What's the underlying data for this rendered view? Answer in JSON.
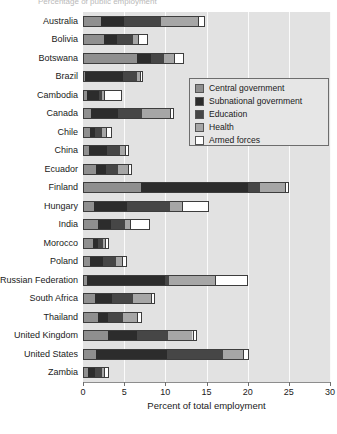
{
  "top_clipped_text": "Percentage of public employment",
  "chart_data": {
    "type": "bar",
    "orientation": "horizontal-stacked",
    "title": "",
    "xlabel": "Percent of total employment",
    "ylabel": "",
    "xlim": [
      0,
      30
    ],
    "xticks": [
      0,
      5,
      10,
      15,
      20,
      25,
      30
    ],
    "grid": true,
    "legend_position": "inside-upper-right",
    "categories": [
      "Australia",
      "Bolivia",
      "Botswana",
      "Brazil",
      "Cambodia",
      "Canada",
      "Chile",
      "China",
      "Ecuador",
      "Finland",
      "Hungary",
      "India",
      "Morocco",
      "Poland",
      "Russian Federation",
      "South Africa",
      "Thailand",
      "United Kingdom",
      "United States",
      "Zambia"
    ],
    "series": [
      {
        "name": "Central government",
        "color": "#8f8f8f",
        "values": [
          2.2,
          2.6,
          6.5,
          0.3,
          0.5,
          1.0,
          0.9,
          0.7,
          1.6,
          7.0,
          1.3,
          1.8,
          1.2,
          0.8,
          0.5,
          1.5,
          1.8,
          3.0,
          1.6,
          0.6
        ]
      },
      {
        "name": "Subnational government",
        "color": "#2c2c2c",
        "values": [
          2.8,
          1.5,
          1.8,
          4.6,
          1.4,
          3.2,
          0.5,
          2.2,
          1.2,
          13.0,
          4.0,
          1.6,
          0.6,
          1.6,
          9.5,
          2.0,
          1.2,
          3.5,
          8.6,
          0.8
        ]
      },
      {
        "name": "Education",
        "color": "#464646",
        "values": [
          4.5,
          2.0,
          1.5,
          1.6,
          0.4,
          3.0,
          0.9,
          1.6,
          1.5,
          1.5,
          5.3,
          1.7,
          0.6,
          1.6,
          0.5,
          2.6,
          1.8,
          3.8,
          6.8,
          0.9
        ]
      },
      {
        "name": "Health",
        "color": "#a6a6a6",
        "values": [
          4.5,
          0.6,
          1.2,
          0.4,
          0.3,
          3.4,
          0.5,
          0.6,
          1.2,
          3.0,
          1.4,
          0.6,
          0.3,
          0.7,
          5.5,
          2.2,
          1.8,
          3.0,
          2.4,
          0.3
        ]
      },
      {
        "name": "Armed forces",
        "color": "#ffffff",
        "values": [
          0.8,
          1.2,
          1.3,
          0.4,
          2.1,
          0.4,
          0.7,
          0.5,
          0.5,
          0.5,
          3.3,
          2.4,
          0.4,
          0.7,
          4.0,
          0.5,
          0.6,
          0.5,
          0.8,
          0.5
        ]
      }
    ],
    "legend_entries": [
      "Central government",
      "Subnational government",
      "Education",
      "Health",
      "Armed forces"
    ]
  }
}
